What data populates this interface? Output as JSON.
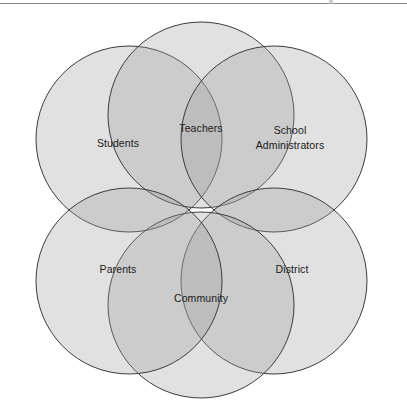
{
  "figure": {
    "type": "venn-diagram",
    "title": "",
    "top_rule_color": "#8c8c8c",
    "background_color": "#ffffff",
    "circle": {
      "fill_color": "#9a9a9a",
      "fill_opacity": 0.3,
      "stroke_color": "#3d3d3d",
      "stroke_width": 1,
      "radius": 93
    },
    "center": {
      "x": 201,
      "y": 210
    },
    "sets": [
      {
        "key": "students",
        "label": "Students",
        "label_lines": [
          "Students"
        ],
        "cx": 129,
        "cy": 139,
        "label_x": 118,
        "label_y": 136
      },
      {
        "key": "teachers",
        "label": "Teachers",
        "label_lines": [
          "Teachers"
        ],
        "cx": 201,
        "cy": 115,
        "label_x": 201,
        "label_y": 121
      },
      {
        "key": "school_administrators",
        "label": "School Administrators",
        "label_lines": [
          "School",
          "Administrators"
        ],
        "cx": 274,
        "cy": 139,
        "label_x": 290,
        "label_y": 123
      },
      {
        "key": "district",
        "label": "District",
        "label_lines": [
          "District"
        ],
        "cx": 274,
        "cy": 281,
        "label_x": 292,
        "label_y": 262
      },
      {
        "key": "community",
        "label": "Community",
        "label_lines": [
          "Community"
        ],
        "cx": 201,
        "cy": 305,
        "label_x": 201,
        "label_y": 291
      },
      {
        "key": "parents",
        "label": "Parents",
        "label_lines": [
          "Parents"
        ],
        "cx": 129,
        "cy": 281,
        "label_x": 118,
        "label_y": 262
      }
    ]
  }
}
